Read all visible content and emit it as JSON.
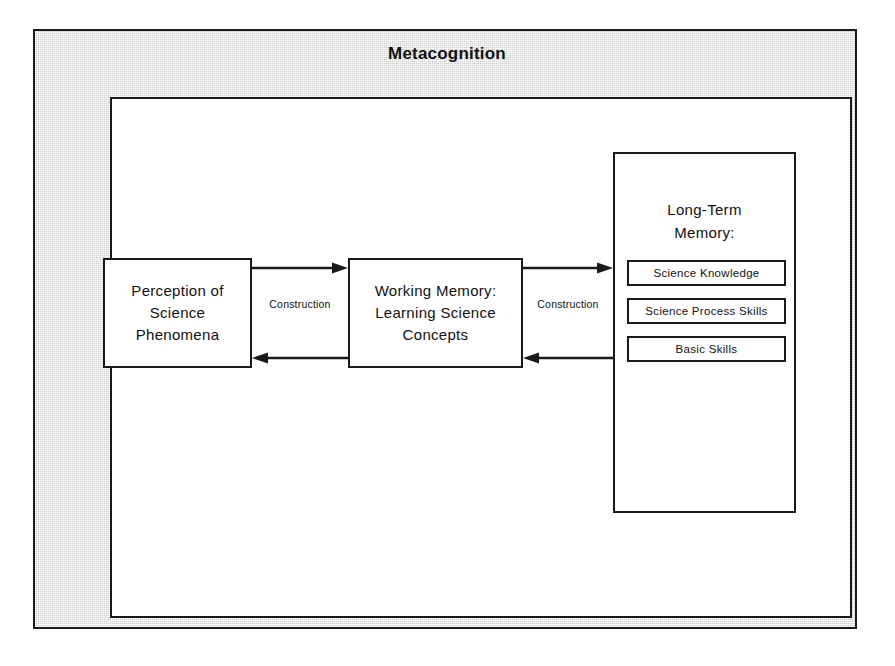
{
  "diagram": {
    "title": "Metacognition",
    "frame": {
      "label_top": "Metacognition",
      "label_bottom": "Metacognition",
      "fill_color": "#cfcfcf",
      "border_color": "#1a1a1a"
    },
    "nodes": [
      {
        "id": "perception",
        "label": "Perception  of\nScience\nPhenomena"
      },
      {
        "id": "working-memory",
        "label": "Working  Memory:\nLearning  Science\nConcepts"
      },
      {
        "id": "long-term-memory",
        "label": "Long-Term\nMemory:",
        "items": [
          "Science Knowledge",
          "Science Process Skills",
          "Basic  Skills"
        ]
      }
    ],
    "connectors": [
      {
        "id": "perception-working-memory",
        "label": "Construction",
        "from": "perception",
        "to": "working-memory",
        "bidirectional": true
      },
      {
        "id": "working-memory-long-term-memory",
        "label": "Construction",
        "from": "working-memory",
        "to": "long-term-memory",
        "bidirectional": true
      }
    ]
  }
}
